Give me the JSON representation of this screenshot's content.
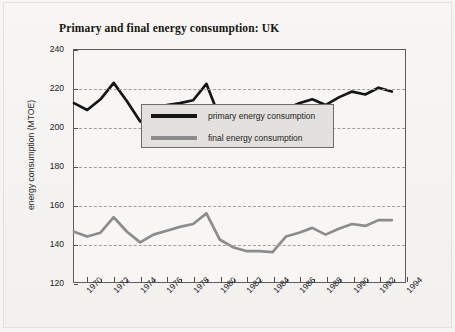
{
  "chart_data": {
    "type": "line",
    "title": "Primary and final energy consumption: UK",
    "xlabel": "",
    "ylabel": "energy consumption (MTOE)",
    "xlim": [
      1969,
      1994
    ],
    "ylim": [
      120,
      240
    ],
    "yticks": [
      120,
      140,
      160,
      180,
      200,
      220,
      240
    ],
    "xticks": [
      1970,
      1972,
      1974,
      1976,
      1978,
      1980,
      1982,
      1984,
      1986,
      1988,
      1990,
      1992,
      1994
    ],
    "x": [
      1969,
      1970,
      1971,
      1972,
      1973,
      1974,
      1975,
      1976,
      1977,
      1978,
      1979,
      1980,
      1981,
      1982,
      1983,
      1984,
      1985,
      1986,
      1987,
      1988,
      1989,
      1990,
      1991,
      1992,
      1993
    ],
    "grid": "horizontal dashed",
    "legend_position": "center-right",
    "series": [
      {
        "name": "primary energy consumption",
        "color": "#151515",
        "values": [
          212.5,
          209.0,
          214.5,
          223.0,
          213.5,
          203.0,
          206.5,
          211.5,
          212.5,
          214.0,
          222.5,
          205.0,
          199.5,
          196.0,
          197.0,
          196.5,
          209.5,
          212.5,
          214.5,
          211.5,
          215.5,
          218.5,
          217.0,
          220.5,
          218.5
        ]
      },
      {
        "name": "final energy consumption",
        "color": "#8c8c8c",
        "values": [
          146.0,
          143.5,
          145.5,
          153.5,
          146.0,
          140.5,
          144.5,
          146.5,
          148.5,
          150.0,
          155.5,
          142.0,
          138.0,
          136.0,
          136.0,
          135.5,
          143.5,
          145.5,
          148.0,
          144.5,
          147.5,
          150.0,
          149.0,
          152.0,
          152.0
        ]
      }
    ]
  },
  "legend": {
    "entries": [
      {
        "label": "primary energy consumption",
        "color": "#151515"
      },
      {
        "label": "final energy consumption",
        "color": "#8c8c8c"
      }
    ]
  }
}
